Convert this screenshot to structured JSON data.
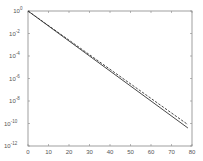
{
  "chart_data": {
    "type": "line",
    "title": "",
    "xlabel": "",
    "ylabel": "",
    "xlim": [
      0,
      80
    ],
    "ylim_log10": [
      -12,
      0
    ],
    "yscale": "log",
    "grid": false,
    "legend": null,
    "x_ticks": [
      "0",
      "10",
      "20",
      "30",
      "40",
      "50",
      "60",
      "70",
      "80"
    ],
    "y_ticks": [
      {
        "base": "10",
        "exp": "0"
      },
      {
        "base": "10",
        "exp": "-2"
      },
      {
        "base": "10",
        "exp": "-4"
      },
      {
        "base": "10",
        "exp": "-6"
      },
      {
        "base": "10",
        "exp": "-8"
      },
      {
        "base": "10",
        "exp": "-10"
      },
      {
        "base": "10",
        "exp": "-12"
      }
    ],
    "series": [
      {
        "name": "solid",
        "style": "solid",
        "color": "#333333",
        "x": [
          0,
          78
        ],
        "log10_y": [
          0,
          -10.4
        ]
      },
      {
        "name": "dashed",
        "style": "dashed",
        "color": "#333333",
        "x": [
          0,
          78
        ],
        "log10_y": [
          0,
          -10.1
        ]
      }
    ]
  }
}
